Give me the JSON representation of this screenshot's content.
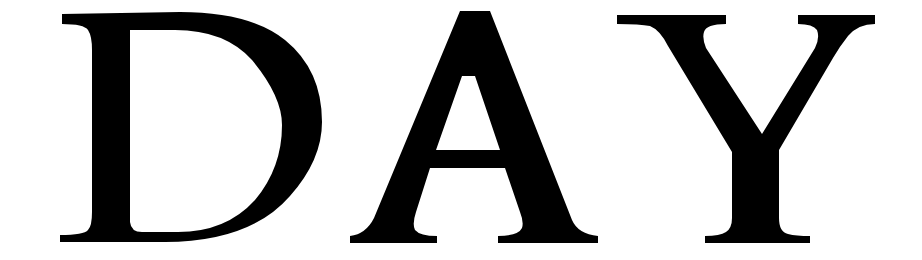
{
  "word": {
    "text": "DAY",
    "letters": [
      "D",
      "A",
      "Y"
    ],
    "color": "#000000",
    "background": "#ffffff"
  }
}
